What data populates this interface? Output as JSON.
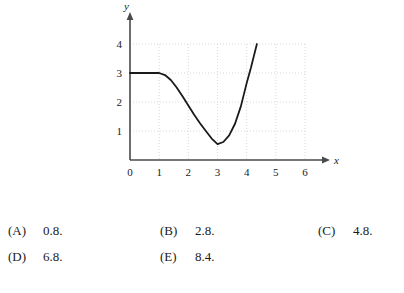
{
  "chart_data": {
    "type": "line",
    "title": "",
    "xlabel": "x",
    "ylabel": "y",
    "xlim": [
      0,
      6.4
    ],
    "ylim": [
      0,
      4.4
    ],
    "xticks": [
      0,
      1,
      2,
      3,
      4,
      5,
      6
    ],
    "xtick_labels": [
      "0",
      "1",
      "2",
      "3",
      "4",
      "5",
      "6"
    ],
    "yticks": [
      1,
      2,
      3,
      4
    ],
    "ytick_labels": [
      "1",
      "2",
      "3",
      "4"
    ],
    "grid": "dotted-light-gray",
    "legend": "none",
    "series": [
      {
        "name": "curve",
        "description": "constant at y=3 from x=0 to x=1, decreasing to a minimum near (3, 0.55), then increasing steeply to y=4 at x=4.35",
        "x": [
          0.0,
          0.5,
          1.0,
          1.2,
          1.4,
          1.6,
          1.8,
          2.0,
          2.2,
          2.4,
          2.6,
          2.8,
          3.0,
          3.2,
          3.4,
          3.6,
          3.8,
          4.0,
          4.15,
          4.25,
          4.35
        ],
        "y": [
          3.0,
          3.0,
          3.0,
          2.93,
          2.76,
          2.5,
          2.2,
          1.88,
          1.56,
          1.27,
          1.0,
          0.74,
          0.55,
          0.62,
          0.85,
          1.25,
          1.85,
          2.65,
          3.2,
          3.6,
          4.0
        ]
      }
    ],
    "colors": {
      "curve": "#1a1a1a",
      "axis": "#4a4a4a",
      "grid": "#d9d9d9",
      "background": "#ffffff"
    }
  },
  "choices": {
    "rows": [
      [
        {
          "tag": "(A)",
          "value": "0.8."
        },
        {
          "tag": "(B)",
          "value": "2.8."
        },
        {
          "tag": "(C)",
          "value": "4.8."
        }
      ],
      [
        {
          "tag": "(D)",
          "value": "6.8."
        },
        {
          "tag": "(E)",
          "value": "8.4."
        }
      ]
    ]
  }
}
